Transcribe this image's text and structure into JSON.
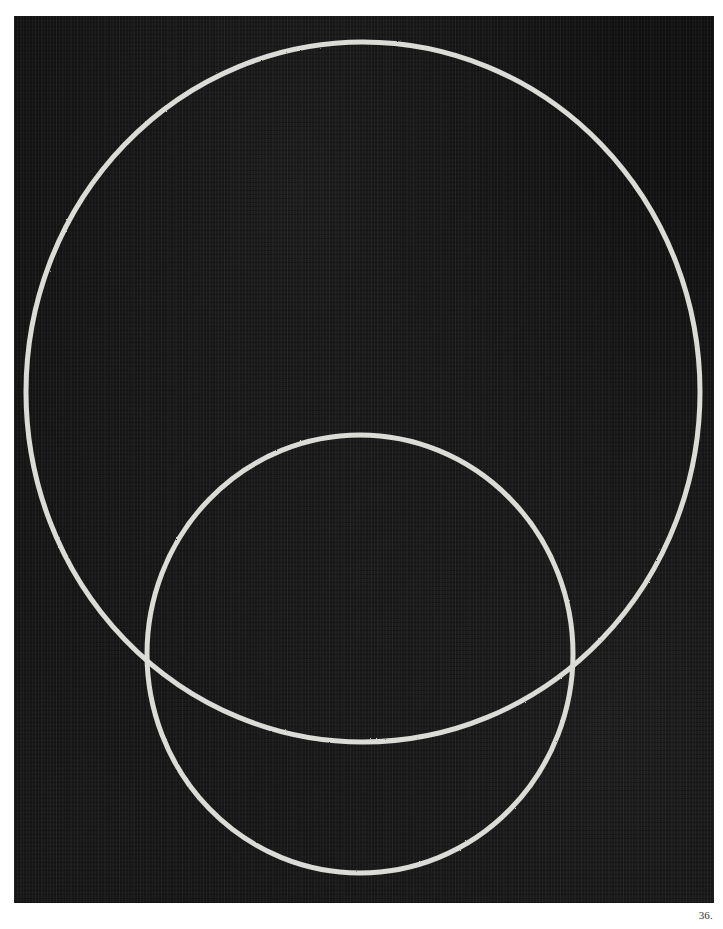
{
  "page": {
    "page_number": "36.",
    "background_color": "#ffffff"
  },
  "artwork": {
    "description": "Abstract painting: two overlapping white circles on a dark textured canvas",
    "canvas_color": "#121212",
    "line_color": "#dcdcd6",
    "shapes": [
      {
        "name": "large-circle",
        "cx": 349,
        "cy": 376,
        "rx": 337,
        "ry": 350,
        "stroke_width": 5
      },
      {
        "name": "small-circle",
        "cx": 346,
        "cy": 638,
        "rx": 213,
        "ry": 219,
        "stroke_width": 5
      }
    ]
  }
}
